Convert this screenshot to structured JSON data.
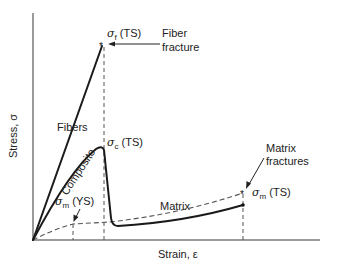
{
  "diagram": {
    "axes": {
      "y_label": "Stress, σ",
      "x_label": "Strain, ε"
    },
    "curves": [
      {
        "name": "Fibers",
        "style": "solid",
        "description": "linear to fiber fracture"
      },
      {
        "name": "Composite",
        "style": "solid",
        "description": "rises to σc (TS), drops sharply, then rises slowly until matrix fractures"
      },
      {
        "name": "Matrix",
        "style": "dashed",
        "description": "yields at σm (YS), then slowly rises to σm (TS)"
      }
    ],
    "labels": {
      "fibers": "Fibers",
      "composite": "Composite",
      "matrix": "Matrix",
      "sigma_f_ts": {
        "symbol": "σ",
        "sub": "f",
        "suffix": " (TS)"
      },
      "sigma_c_ts": {
        "symbol": "σ",
        "sub": "c",
        "suffix": " (TS)"
      },
      "sigma_m_ys": {
        "symbol": "σ",
        "sub": "m",
        "suffix": " (YS)"
      },
      "sigma_m_ts": {
        "symbol": "σ",
        "sub": "m",
        "suffix": " (TS)"
      }
    },
    "annotations": {
      "fiber_fracture_line1": "Fiber",
      "fiber_fracture_line2": "fracture",
      "matrix_fractures_line1": "Matrix",
      "matrix_fractures_line2": "fractures"
    },
    "colors": {
      "axis": "#9a9a9a",
      "curve": "#1a1a1a",
      "dashed": "#555555",
      "text": "#222222"
    }
  }
}
